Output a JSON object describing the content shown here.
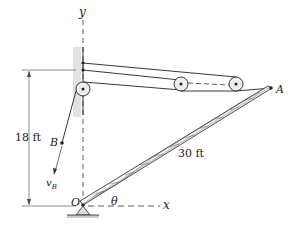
{
  "diagram": {
    "labels": {
      "y_axis": "y",
      "x_axis": "x",
      "point_A": "A",
      "point_B": "B",
      "point_O": "O",
      "angle": "θ",
      "velocity": "v",
      "velocity_sub": "B",
      "height_dim": "18 ft",
      "boom_length": "30 ft"
    },
    "colors": {
      "line": "#222222",
      "wall": "#d8d8d8",
      "ground": "#cccccc"
    }
  }
}
